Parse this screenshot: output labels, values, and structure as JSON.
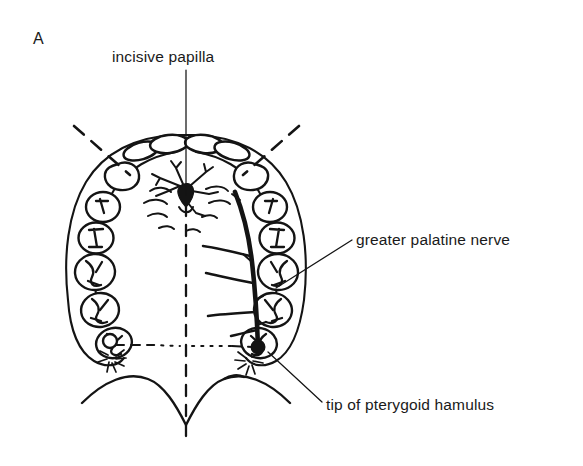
{
  "figure": {
    "panel_label": "A",
    "background_color": "#ffffff",
    "ink_color": "#141414",
    "view": "occlusal view of the maxillary arch and hard palate"
  },
  "labels": [
    {
      "id": "incisive-papilla",
      "text": "incisive papilla",
      "x": 112,
      "y": 62,
      "anchor": "start",
      "leader": {
        "x1": 186,
        "y1": 70,
        "x2": 186,
        "y2": 195
      }
    },
    {
      "id": "greater-palatine-nerve",
      "text": "greater palatine nerve",
      "x": 356,
      "y": 245,
      "anchor": "start",
      "leader": {
        "x1": 352,
        "y1": 240,
        "x2": 276,
        "y2": 288
      }
    },
    {
      "id": "tip-of-pterygoid-hamulus",
      "text": "tip of pterygoid hamulus",
      "x": 326,
      "y": 410,
      "anchor": "start",
      "leader": {
        "x1": 322,
        "y1": 402,
        "x2": 268,
        "y2": 352
      }
    }
  ],
  "anatomy": {
    "teeth_left": [
      {
        "name": "central-incisor-left",
        "type": "incisor"
      },
      {
        "name": "lateral-incisor-left",
        "type": "incisor"
      },
      {
        "name": "canine-left",
        "type": "canine"
      },
      {
        "name": "first-premolar-left",
        "type": "premolar"
      },
      {
        "name": "second-premolar-left",
        "type": "premolar"
      },
      {
        "name": "first-molar-left",
        "type": "molar"
      },
      {
        "name": "second-molar-left",
        "type": "molar"
      },
      {
        "name": "third-molar-left",
        "type": "molar"
      }
    ],
    "teeth_right": [
      {
        "name": "central-incisor-right",
        "type": "incisor"
      },
      {
        "name": "lateral-incisor-right",
        "type": "incisor"
      },
      {
        "name": "canine-right",
        "type": "canine"
      },
      {
        "name": "first-premolar-right",
        "type": "premolar"
      },
      {
        "name": "second-premolar-right",
        "type": "premolar"
      },
      {
        "name": "first-molar-right",
        "type": "molar"
      },
      {
        "name": "second-molar-right",
        "type": "molar"
      },
      {
        "name": "third-molar-right",
        "type": "molar"
      }
    ],
    "structures": [
      "hard-palate-outline",
      "palatal-rugae",
      "incisive-papilla",
      "nasopalatine-nerve-branches",
      "greater-palatine-nerve-trunk",
      "greater-palatine-nerve-branches",
      "greater-palatine-foramen",
      "pterygoid-hamulus-left",
      "pterygoid-hamulus-right",
      "midline-raphe",
      "vibrating-line",
      "soft-palate-margin"
    ]
  }
}
